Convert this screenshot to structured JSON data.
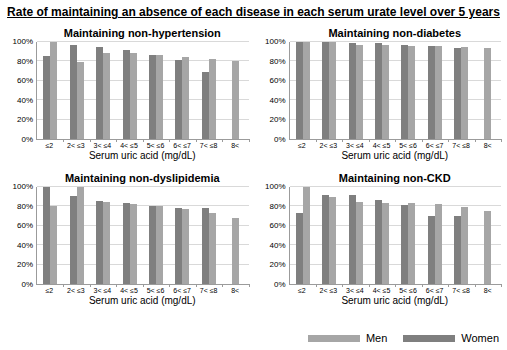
{
  "figure_title": "Rate of maintaining an absence of each disease in each serum urate level over 5 years",
  "colors": {
    "men": "#a6a6a6",
    "women": "#7f7f7f",
    "gridline": "#d9d9d9",
    "axis": "#9b9b9b"
  },
  "legend": [
    {
      "label": "Men",
      "color": "#a6a6a6"
    },
    {
      "label": "Women",
      "color": "#7f7f7f"
    }
  ],
  "legend_position": "bottom-right",
  "chart_data": [
    {
      "type": "bar",
      "title": "Maintaining non-hypertension",
      "xlabel": "Serum uric acid (mg/dL)",
      "ylabel": "",
      "ylim": [
        0,
        100
      ],
      "yticks": [
        0,
        20,
        40,
        60,
        80,
        100
      ],
      "ytick_suffix": "%",
      "grid": true,
      "categories": [
        "≤2",
        "2< ≤3",
        "3< ≤4",
        "4< ≤5",
        "5< ≤6",
        "6< ≤7",
        "7< ≤8",
        "8<"
      ],
      "series": [
        {
          "name": "Women",
          "color": "#7f7f7f",
          "values": [
            86,
            97,
            95,
            92,
            87,
            81,
            69,
            null
          ]
        },
        {
          "name": "Men",
          "color": "#a6a6a6",
          "values": [
            100,
            79,
            89,
            89,
            87,
            85,
            83,
            80
          ]
        }
      ]
    },
    {
      "type": "bar",
      "title": "Maintaining non-diabetes",
      "xlabel": "Serum uric acid (mg/dL)",
      "ylabel": "",
      "ylim": [
        0,
        100
      ],
      "yticks": [
        0,
        20,
        40,
        60,
        80,
        100
      ],
      "ytick_suffix": "%",
      "grid": true,
      "categories": [
        "≤2",
        "2< ≤3",
        "3< ≤4",
        "4< ≤5",
        "5< ≤6",
        "6< ≤7",
        "7< ≤8",
        "8<"
      ],
      "series": [
        {
          "name": "Women",
          "color": "#7f7f7f",
          "values": [
            100,
            100,
            99,
            99,
            97,
            96,
            94,
            null
          ]
        },
        {
          "name": "Men",
          "color": "#a6a6a6",
          "values": [
            100,
            100,
            97,
            97,
            96,
            96,
            95,
            94
          ]
        }
      ]
    },
    {
      "type": "bar",
      "title": "Maintaining non-dyslipidemia",
      "xlabel": "Serum uric acid (mg/dL)",
      "ylabel": "",
      "ylim": [
        0,
        100
      ],
      "yticks": [
        0,
        20,
        40,
        60,
        80,
        100
      ],
      "ytick_suffix": "%",
      "grid": true,
      "categories": [
        "≤2",
        "2< ≤3",
        "3< ≤4",
        "4< ≤5",
        "5< ≤6",
        "6< ≤7",
        "7< ≤8",
        "8<"
      ],
      "series": [
        {
          "name": "Women",
          "color": "#7f7f7f",
          "values": [
            100,
            91,
            86,
            84,
            80,
            78,
            78,
            null
          ]
        },
        {
          "name": "Men",
          "color": "#a6a6a6",
          "values": [
            80,
            100,
            85,
            82,
            80,
            77,
            73,
            68
          ]
        }
      ]
    },
    {
      "type": "bar",
      "title": "Maintaining non-CKD",
      "xlabel": "Serum uric acid (mg/dL)",
      "ylabel": "",
      "ylim": [
        0,
        100
      ],
      "yticks": [
        0,
        20,
        40,
        60,
        80,
        100
      ],
      "ytick_suffix": "%",
      "grid": true,
      "categories": [
        "≤2",
        "2< ≤3",
        "3< ≤4",
        "4< ≤5",
        "5< ≤6",
        "6< ≤7",
        "7< ≤8",
        "8<"
      ],
      "series": [
        {
          "name": "Women",
          "color": "#7f7f7f",
          "values": [
            73,
            92,
            92,
            87,
            81,
            70,
            70,
            null
          ]
        },
        {
          "name": "Men",
          "color": "#a6a6a6",
          "values": [
            100,
            90,
            85,
            84,
            84,
            83,
            79,
            75
          ]
        }
      ]
    }
  ]
}
